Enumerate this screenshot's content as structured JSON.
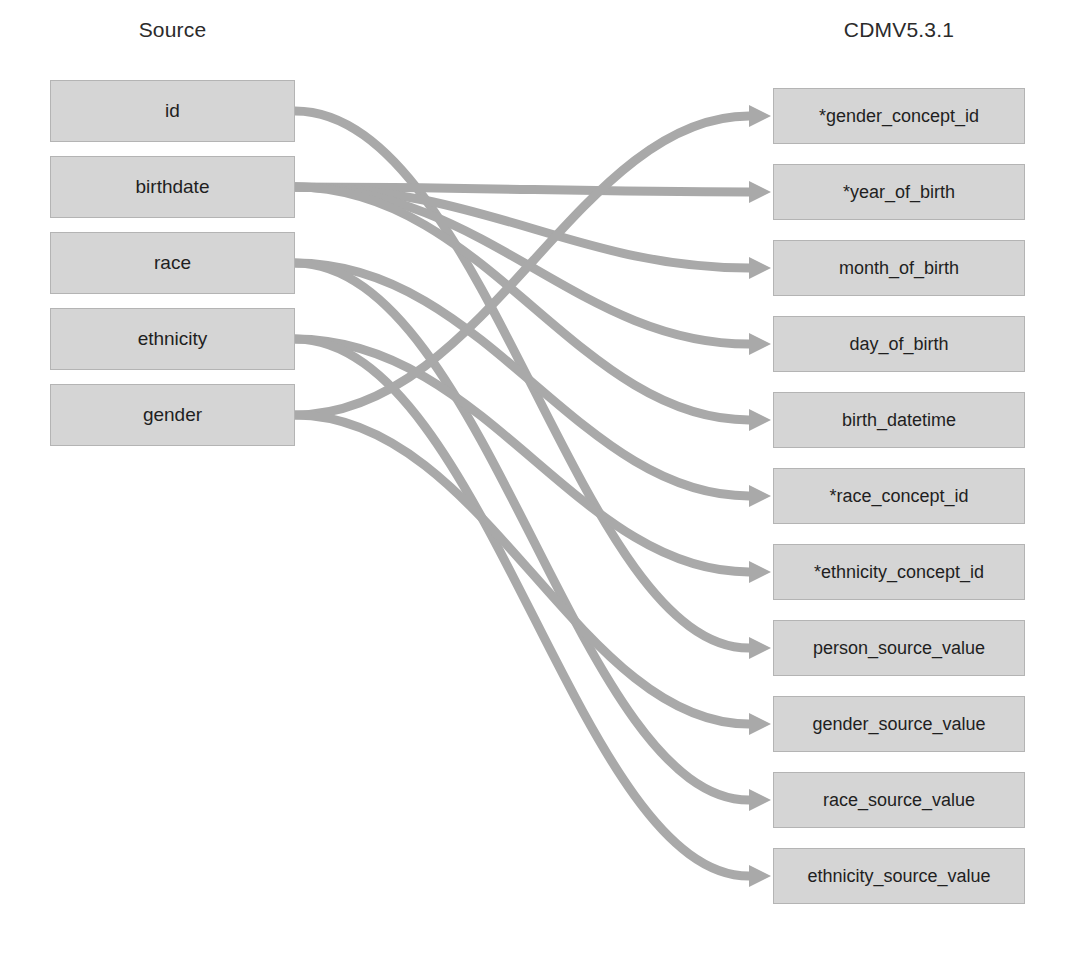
{
  "diagram": {
    "columns": {
      "source_header": "Source",
      "target_header": "CDMV5.3.1"
    },
    "colors": {
      "node_fill": "#d5d5d5",
      "node_border": "#b4b4b4",
      "edge": "#a9a9a9",
      "text": "#1f1f1f"
    },
    "source_fields": [
      {
        "id": "s0",
        "label": "id"
      },
      {
        "id": "s1",
        "label": "birthdate"
      },
      {
        "id": "s2",
        "label": "race"
      },
      {
        "id": "s3",
        "label": "ethnicity"
      },
      {
        "id": "s4",
        "label": "gender"
      }
    ],
    "target_fields": [
      {
        "id": "t0",
        "label": "*gender_concept_id"
      },
      {
        "id": "t1",
        "label": "*year_of_birth"
      },
      {
        "id": "t2",
        "label": "month_of_birth"
      },
      {
        "id": "t3",
        "label": "day_of_birth"
      },
      {
        "id": "t4",
        "label": "birth_datetime"
      },
      {
        "id": "t5",
        "label": "*race_concept_id"
      },
      {
        "id": "t6",
        "label": "*ethnicity_concept_id"
      },
      {
        "id": "t7",
        "label": "person_source_value"
      },
      {
        "id": "t8",
        "label": "gender_source_value"
      },
      {
        "id": "t9",
        "label": "race_source_value"
      },
      {
        "id": "t10",
        "label": "ethnicity_source_value"
      }
    ],
    "mappings": [
      {
        "from": "id",
        "to": "person_source_value"
      },
      {
        "from": "birthdate",
        "to": "*year_of_birth"
      },
      {
        "from": "birthdate",
        "to": "month_of_birth"
      },
      {
        "from": "birthdate",
        "to": "day_of_birth"
      },
      {
        "from": "birthdate",
        "to": "birth_datetime"
      },
      {
        "from": "race",
        "to": "*race_concept_id"
      },
      {
        "from": "race",
        "to": "race_source_value"
      },
      {
        "from": "ethnicity",
        "to": "*ethnicity_concept_id"
      },
      {
        "from": "ethnicity",
        "to": "ethnicity_source_value"
      },
      {
        "from": "gender",
        "to": "*gender_concept_id"
      },
      {
        "from": "gender",
        "to": "gender_source_value"
      }
    ]
  }
}
